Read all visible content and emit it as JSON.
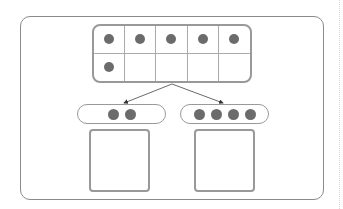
{
  "diagram": {
    "ten_frame": {
      "rows": 2,
      "columns": 5,
      "filled_cells": [
        true,
        true,
        true,
        true,
        true,
        true,
        false,
        false,
        false,
        false
      ],
      "total_dots": 6
    },
    "parts": [
      {
        "label": "left-part",
        "dots": 2,
        "answer_box": ""
      },
      {
        "label": "right-part",
        "dots": 4,
        "answer_box": ""
      }
    ],
    "colors": {
      "dot": "#6b6b6b",
      "border": "#999999",
      "frame_border": "#8a8a8a"
    }
  }
}
